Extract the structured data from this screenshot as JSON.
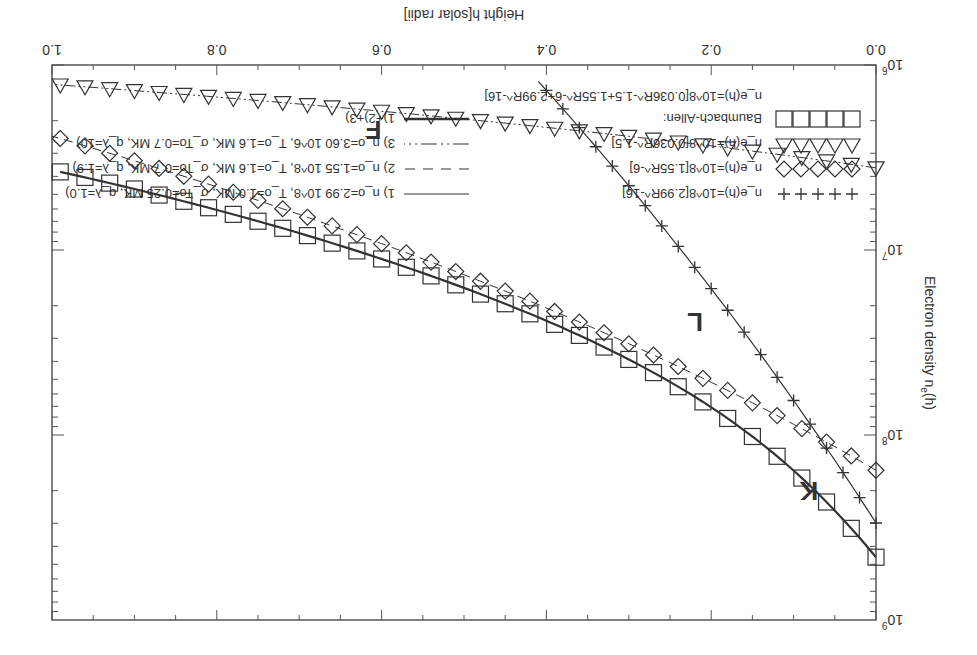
{
  "chart_data": {
    "type": "scatter",
    "title": "",
    "xlabel": "Height  h[solar radii]",
    "ylabel": "Electron density  n_e(h)",
    "xlim": [
      0.0,
      1.0
    ],
    "ylim": [
      1000000,
      1000000000
    ],
    "yscale": "log",
    "grid": false,
    "x_ticks": [
      "0.0",
      "0.2",
      "0.4",
      "0.6",
      "0.8",
      "1.0"
    ],
    "y_ticks": [
      "10^6",
      "10^7",
      "10^8",
      "10^9"
    ],
    "legend_position": "upper right (in rotated view: lower left of figure)",
    "rotation_deg": 180,
    "region_labels": [
      {
        "text": "K",
        "x": 0.07,
        "y": 180000000
      },
      {
        "text": "L",
        "x": 0.21,
        "y": 22000000
      },
      {
        "text": "F",
        "x": 0.6,
        "y": 2000000
      }
    ],
    "series": [
      {
        "name": "n_e(h)=10^8[2.99R^-16]",
        "marker": "+",
        "component": "K-corona",
        "x": [
          0.0,
          0.02,
          0.04,
          0.06,
          0.08,
          0.1,
          0.12,
          0.14,
          0.16,
          0.18,
          0.2,
          0.22,
          0.24,
          0.26,
          0.28,
          0.3,
          0.32,
          0.34,
          0.36,
          0.38,
          0.4
        ],
        "values": [
          299000000,
          217000000,
          159000000,
          118000000,
          88000000,
          66000000,
          50000000,
          38000000,
          29000000,
          22500000,
          17500000,
          13700000,
          10800000,
          8500000,
          6700000,
          5300000,
          4200000,
          3400000,
          2700000,
          2200000,
          1800000
        ]
      },
      {
        "name": "n_e(h)=10^8[1.55R^-6]",
        "marker": "diamond",
        "component": "L-corona",
        "x": [
          0.0,
          0.05,
          0.1,
          0.15,
          0.2,
          0.25,
          0.3,
          0.35,
          0.4,
          0.45,
          0.5,
          0.55,
          0.6,
          0.65,
          0.7,
          0.75,
          0.8,
          0.85,
          0.9,
          0.95,
          1.0
        ],
        "values": [
          155000000,
          116000000,
          87500000,
          67000000,
          52000000,
          40600000,
          32100000,
          25600000,
          20600000,
          16700000,
          13600000,
          11200000,
          9300000,
          7700000,
          6400000,
          5400000,
          4600000,
          3900000,
          3300000,
          2800000,
          2400000
        ]
      },
      {
        "name": "n_e(h)=10^8[0.036R^-1.5]",
        "marker": "triangle-down",
        "component": "F-corona",
        "x": [
          0.0,
          0.05,
          0.1,
          0.15,
          0.2,
          0.25,
          0.3,
          0.35,
          0.4,
          0.45,
          0.5,
          0.55,
          0.6,
          0.65,
          0.7,
          0.75,
          0.8,
          0.85,
          0.9,
          0.95,
          1.0
        ],
        "values": [
          3600000,
          3350000,
          3120000,
          2920000,
          2740000,
          2580000,
          2430000,
          2290000,
          2170000,
          2060000,
          1950000,
          1860000,
          1770000,
          1690000,
          1610000,
          1540000,
          1480000,
          1420000,
          1360000,
          1310000,
          1270000
        ]
      },
      {
        "name": "Baumbach-Allen: n_e(h)=10^8[0.036R^-1.5+1.55R^-6+2.99R^-16]",
        "marker": "square",
        "component": "sum",
        "x": [
          0.0,
          0.05,
          0.1,
          0.15,
          0.2,
          0.25,
          0.3,
          0.35,
          0.4,
          0.45,
          0.5,
          0.55,
          0.6,
          0.65,
          0.7,
          0.75,
          0.8,
          0.85,
          0.9,
          0.95,
          1.0
        ],
        "values": [
          458000000,
          276000000,
          173000000,
          113000000,
          77000000,
          54000000,
          38500000,
          28300000,
          21200000,
          16300000,
          12800000,
          10100000,
          8200000,
          6700000,
          5600000,
          4700000,
          4000000,
          3400000,
          2950000,
          2560000,
          2250000
        ]
      },
      {
        "name": "1) n_o=2.99 10^8, T_o=1.0 MK, σ_To=0.25 MK, q_λ=1.0)",
        "line": "solid-thin",
        "x": [
          0.0,
          0.4
        ],
        "values": [
          299000000,
          1800000
        ]
      },
      {
        "name": "2) n_o=1.55 10^8, T_o=1.6 MK, σ_To=0.7 MK, q_λ=1.9)",
        "line": "dashed",
        "x": [
          0.0,
          1.0
        ],
        "values": [
          155000000,
          2400000
        ]
      },
      {
        "name": "3) n_o=3.60 10^6, T_o=1.6 MK, σ_To=0.7 MK, q_λ=10)",
        "line": "dash-dot-dot",
        "x": [
          0.0,
          1.0
        ],
        "values": [
          3600000,
          1270000
        ]
      },
      {
        "name": "1)+2)+3)",
        "line": "solid-thick",
        "x": [
          0.0,
          1.0
        ],
        "values": [
          458000000,
          2250000
        ]
      }
    ]
  },
  "axes": {
    "xlabel": "Height  h[solar radii]",
    "ylabel_main": "Electron density  n",
    "ylabel_sub": "e",
    "ylabel_tail": "(h)",
    "x_ticks": [
      "0.0",
      "0.2",
      "0.4",
      "0.6",
      "0.8",
      "1.0"
    ],
    "y_ticks": [
      {
        "base": "10",
        "exp": "6"
      },
      {
        "base": "10",
        "exp": "7"
      },
      {
        "base": "10",
        "exp": "8"
      },
      {
        "base": "10",
        "exp": "9"
      }
    ]
  },
  "labels": {
    "K": "K",
    "L": "L",
    "F": "F"
  },
  "legend": {
    "left": [
      {
        "text": "n_e(h)=10^8[2.99R^-16]",
        "marker": "plus"
      },
      {
        "text": "n_e(h)=10^8[1.55R^-6]",
        "marker": "diamond"
      },
      {
        "text": "n_e(h)=10^8[0.036R^-1.5]",
        "marker": "triangle"
      },
      {
        "text": "Baumbach-Allen:",
        "marker": "square"
      },
      {
        "text": "n_e(h)=10^8[0.036R^-1.5+1.55R^-6+2.99R^-16]",
        "marker": ""
      }
    ],
    "right": [
      {
        "text": "1) n_o=2.99 10^8, T_o=1.0 MK, σ_To=0.25 MK, q_λ=1.0)",
        "line": "solid"
      },
      {
        "text": "2) n_o=1.55 10^8, T_o=1.6 MK, σ_To=0.7 MK, q_λ=1.9)",
        "line": "dashed"
      },
      {
        "text": "3) n_o=3.60 10^6, T_o=1.6 MK, σ_To=0.7 MK, q_λ=10)",
        "line": "dashdotdot"
      },
      {
        "text": "1)+2)+3)",
        "line": "thick"
      }
    ]
  },
  "colors": {
    "ink": "#333333",
    "frame": "#555555",
    "background": "#ffffff"
  }
}
